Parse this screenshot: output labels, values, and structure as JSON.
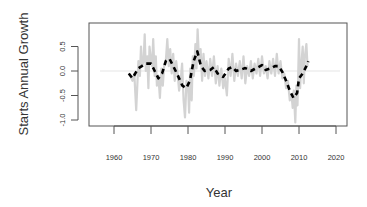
{
  "chart_data": {
    "type": "line",
    "title": "",
    "xlabel": "Year",
    "ylabel": "Starts Annual Growth",
    "xlim": [
      1953.3,
      2022.7
    ],
    "ylim": [
      -1.12,
      0.98
    ],
    "x_ticks": [
      1960,
      1970,
      1980,
      1990,
      2000,
      2010,
      2020
    ],
    "x_tick_labels": [
      "1960",
      "1970",
      "1980",
      "1990",
      "2000",
      "2010",
      "2020"
    ],
    "y_ticks": [
      -1.0,
      -0.5,
      0.0,
      0.5
    ],
    "y_tick_labels": [
      "-1.0",
      "-0.5",
      "0.0",
      "0.5"
    ],
    "grid": false,
    "legend": null,
    "reference_line": {
      "y": 0.0,
      "color": "#eeeeee"
    },
    "series": [
      {
        "name": "Monthly annual growth (raw)",
        "style": "solid",
        "color": "#d3d3d3",
        "x": [
          1964.0,
          1964.5,
          1965.0,
          1965.5,
          1966.0,
          1966.3,
          1966.6,
          1967.0,
          1967.3,
          1967.6,
          1968.0,
          1968.3,
          1968.6,
          1969.0,
          1969.3,
          1969.6,
          1970.0,
          1970.3,
          1970.6,
          1971.0,
          1971.3,
          1971.6,
          1972.0,
          1972.4,
          1972.8,
          1973.2,
          1973.6,
          1974.0,
          1974.4,
          1974.8,
          1975.2,
          1975.6,
          1976.0,
          1976.4,
          1976.8,
          1977.2,
          1977.6,
          1978.0,
          1978.4,
          1978.8,
          1979.2,
          1979.6,
          1980.0,
          1980.3,
          1980.6,
          1981.0,
          1981.3,
          1981.6,
          1982.0,
          1982.3,
          1982.6,
          1983.0,
          1983.4,
          1983.8,
          1984.2,
          1984.6,
          1985.0,
          1985.5,
          1986.0,
          1986.5,
          1987.0,
          1987.5,
          1988.0,
          1988.5,
          1989.0,
          1989.5,
          1990.0,
          1990.5,
          1991.0,
          1991.5,
          1992.0,
          1992.5,
          1993.0,
          1993.5,
          1994.0,
          1994.5,
          1995.0,
          1995.5,
          1996.0,
          1996.5,
          1997.0,
          1997.5,
          1998.0,
          1998.5,
          1999.0,
          1999.5,
          2000.0,
          2000.5,
          2001.0,
          2001.5,
          2002.0,
          2002.5,
          2003.0,
          2003.5,
          2004.0,
          2004.5,
          2005.0,
          2005.5,
          2006.0,
          2006.5,
          2007.0,
          2007.5,
          2008.0,
          2008.3,
          2008.6,
          2009.0,
          2009.3,
          2009.6,
          2010.0,
          2010.3,
          2010.6,
          2011.0,
          2011.3,
          2011.6,
          2012.0,
          2012.3
        ],
        "y": [
          -0.05,
          -0.12,
          -0.2,
          -0.05,
          -0.8,
          -0.3,
          0.2,
          -0.1,
          0.5,
          0.1,
          0.2,
          0.75,
          0.0,
          0.3,
          -0.35,
          0.5,
          0.2,
          0.1,
          0.65,
          -0.1,
          0.3,
          -0.3,
          -0.1,
          -0.55,
          0.05,
          -0.3,
          0.15,
          0.2,
          0.65,
          0.1,
          0.45,
          -0.05,
          0.35,
          -0.2,
          0.2,
          -0.05,
          -0.4,
          -0.2,
          0.15,
          -0.6,
          -0.95,
          -0.2,
          -0.25,
          -0.85,
          0.05,
          -0.6,
          0.3,
          -0.1,
          0.55,
          0.05,
          0.85,
          0.2,
          0.45,
          -0.2,
          0.35,
          -0.1,
          0.2,
          -0.15,
          0.25,
          -0.1,
          0.3,
          -0.25,
          0.1,
          -0.3,
          0.05,
          -0.35,
          -0.15,
          -0.5,
          0.25,
          -0.1,
          0.35,
          -0.2,
          0.15,
          -0.1,
          0.2,
          -0.15,
          0.3,
          -0.25,
          0.1,
          -0.1,
          0.2,
          -0.15,
          0.15,
          -0.05,
          0.25,
          -0.1,
          0.3,
          -0.05,
          0.1,
          -0.15,
          0.2,
          -0.05,
          0.25,
          -0.1,
          0.35,
          -0.05,
          0.2,
          -0.15,
          -0.05,
          -0.35,
          -0.2,
          -0.6,
          -0.5,
          -0.75,
          -0.4,
          -1.05,
          -0.3,
          -0.7,
          0.65,
          -0.35,
          0.1,
          0.5,
          -0.25,
          0.3,
          0.55,
          0.1
        ]
      },
      {
        "name": "Smoothed trend",
        "style": "dashed",
        "color": "#000000",
        "x": [
          1964.0,
          1965.0,
          1966.5,
          1967.5,
          1968.5,
          1970.0,
          1971.0,
          1972.0,
          1973.0,
          1974.0,
          1975.0,
          1976.0,
          1977.0,
          1978.5,
          1979.5,
          1980.5,
          1981.5,
          1982.5,
          1983.5,
          1984.5,
          1986.0,
          1987.0,
          1988.0,
          1989.5,
          1991.0,
          1992.0,
          1993.0,
          1994.0,
          1995.5,
          1997.0,
          1998.0,
          1999.0,
          2000.0,
          2001.0,
          2002.5,
          2003.5,
          2004.5,
          2005.5,
          2006.5,
          2007.5,
          2008.5,
          2009.5,
          2010.0,
          2011.0,
          2012.0,
          2012.5
        ],
        "y": [
          -0.05,
          -0.15,
          0.05,
          0.1,
          0.15,
          0.15,
          0.0,
          -0.15,
          -0.05,
          0.2,
          0.25,
          0.1,
          -0.05,
          -0.3,
          -0.35,
          -0.2,
          0.2,
          0.4,
          0.1,
          0.0,
          0.02,
          0.08,
          -0.05,
          -0.12,
          0.05,
          0.08,
          0.0,
          0.02,
          0.06,
          0.0,
          0.04,
          0.08,
          0.12,
          0.02,
          0.06,
          0.1,
          0.1,
          -0.02,
          -0.2,
          -0.4,
          -0.55,
          -0.45,
          -0.15,
          -0.05,
          0.1,
          0.2
        ]
      }
    ]
  }
}
